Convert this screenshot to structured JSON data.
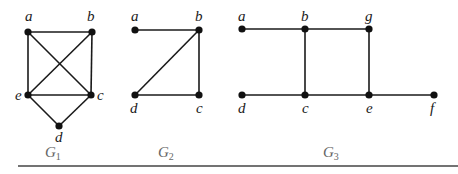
{
  "figure": {
    "bottom_rule": {
      "x1": 18,
      "x2": 458,
      "y": 166
    },
    "graphs": [
      {
        "id": "G1",
        "label": "G",
        "subscript": "1",
        "label_pos": [
          45,
          157
        ],
        "nodes": [
          {
            "name": "a",
            "x": 28,
            "y": 32,
            "lx": 25,
            "ly": 21
          },
          {
            "name": "b",
            "x": 92,
            "y": 32,
            "lx": 87,
            "ly": 21
          },
          {
            "name": "e",
            "x": 28,
            "y": 95,
            "lx": 15,
            "ly": 100
          },
          {
            "name": "c",
            "x": 91,
            "y": 95,
            "lx": 97,
            "ly": 100
          },
          {
            "name": "d",
            "x": 59,
            "y": 126,
            "lx": 55,
            "ly": 142
          }
        ],
        "edges": [
          [
            "a",
            "b"
          ],
          [
            "a",
            "e"
          ],
          [
            "a",
            "c"
          ],
          [
            "b",
            "e"
          ],
          [
            "b",
            "c"
          ],
          [
            "e",
            "c"
          ],
          [
            "e",
            "d"
          ],
          [
            "c",
            "d"
          ]
        ]
      },
      {
        "id": "G2",
        "label": "G",
        "subscript": "2",
        "label_pos": [
          158,
          157
        ],
        "nodes": [
          {
            "name": "a",
            "x": 135,
            "y": 30,
            "lx": 131,
            "ly": 21
          },
          {
            "name": "b",
            "x": 199,
            "y": 30,
            "lx": 195,
            "ly": 21
          },
          {
            "name": "d",
            "x": 135,
            "y": 95,
            "lx": 130,
            "ly": 113
          },
          {
            "name": "c",
            "x": 199,
            "y": 95,
            "lx": 196,
            "ly": 113
          }
        ],
        "edges": [
          [
            "a",
            "b"
          ],
          [
            "b",
            "c"
          ],
          [
            "b",
            "d"
          ],
          [
            "d",
            "c"
          ]
        ]
      },
      {
        "id": "G3",
        "label": "G",
        "subscript": "3",
        "label_pos": [
          323,
          157
        ],
        "nodes": [
          {
            "name": "a",
            "x": 242,
            "y": 29,
            "lx": 238,
            "ly": 21
          },
          {
            "name": "b",
            "x": 305,
            "y": 29,
            "lx": 301,
            "ly": 21
          },
          {
            "name": "g",
            "x": 369,
            "y": 29,
            "lx": 365,
            "ly": 21
          },
          {
            "name": "d",
            "x": 242,
            "y": 95,
            "lx": 238,
            "ly": 113
          },
          {
            "name": "c",
            "x": 305,
            "y": 95,
            "lx": 302,
            "ly": 113
          },
          {
            "name": "e",
            "x": 369,
            "y": 95,
            "lx": 366,
            "ly": 113
          },
          {
            "name": "f",
            "x": 434,
            "y": 95,
            "lx": 430,
            "ly": 113
          }
        ],
        "edges": [
          [
            "a",
            "b"
          ],
          [
            "b",
            "g"
          ],
          [
            "b",
            "c"
          ],
          [
            "g",
            "e"
          ],
          [
            "d",
            "c"
          ],
          [
            "c",
            "e"
          ],
          [
            "e",
            "f"
          ]
        ]
      }
    ]
  }
}
